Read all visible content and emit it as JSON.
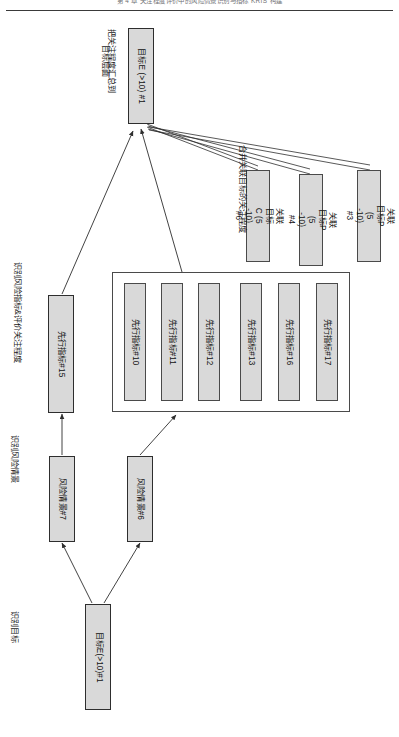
{
  "page": {
    "running_head": "第 4 章   关注程度评价中的风险情景识别与指标 KRIS 构建",
    "orientation_note": "diagram rotated 90 degrees"
  },
  "figure": {
    "phases": [
      {
        "id": "phase-identify-objective",
        "label": "识别目标"
      },
      {
        "id": "phase-identify-scenario",
        "label": "识别风险情景"
      },
      {
        "id": "phase-identify-indicator",
        "label": "识别风险指标&评价关注程度"
      },
      {
        "id": "phase-merge-related",
        "label": "合并关联目标的关注程度"
      },
      {
        "id": "phase-rollup",
        "label": "把关注程度汇总到\n目标层面"
      }
    ],
    "phase_rollup_lines": [
      "把关注程度汇总到",
      "目标层面"
    ],
    "nodes": {
      "objective_bottom": {
        "label": "目标E(>10)#1"
      },
      "objective_top": {
        "label": "目标E (>10) #1"
      },
      "scenarios": [
        {
          "label": "风险情景#7"
        },
        {
          "label": "风险情景#6"
        }
      ],
      "indicator_left": {
        "label": "先行指标#15"
      },
      "indicator_group": [
        {
          "label": "先行指标#10"
        },
        {
          "label": "先行指标#11"
        },
        {
          "label": "先行指标#12"
        },
        {
          "label": "先行指标#13"
        },
        {
          "label": "先行指标#16"
        },
        {
          "label": "先行指标#17"
        }
      ],
      "related_objectives": [
        {
          "label": "关联目标C (5 -10)\n#6"
        },
        {
          "label": "关联目标P (5 -10)\n#4"
        },
        {
          "label": "关联目标P (5 -10)\n#3"
        }
      ],
      "related_objectives_lines": [
        [
          "关联目标C (5 -10)",
          "#6"
        ],
        [
          "关联目标P (5 -10)",
          "#4"
        ],
        [
          "关联目标P (5 -10)",
          "#3"
        ]
      ]
    },
    "colors": {
      "node_fill": "#d9d9d9",
      "node_stroke": "#4a4a4a",
      "connector": "#3a3a3a",
      "page_background": "#ffffff"
    }
  }
}
